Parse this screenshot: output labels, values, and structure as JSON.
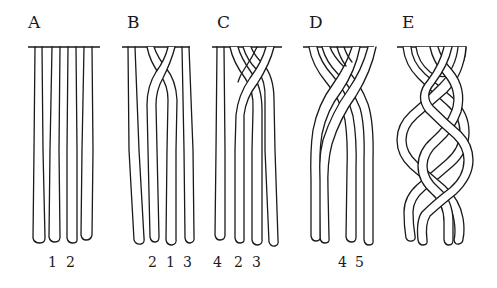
{
  "figure": {
    "stroke_color": "#1a1a1a",
    "background": "#ffffff",
    "panels": [
      {
        "id": "A",
        "label": "A",
        "label_pos": [
          28,
          14
        ],
        "bar": [
          28,
          100
        ],
        "numbers": [
          {
            "text": "1",
            "x": 48
          },
          {
            "text": "2",
            "x": 66
          }
        ]
      },
      {
        "id": "B",
        "label": "B",
        "label_pos": [
          127,
          14
        ],
        "bar": [
          122,
          190
        ],
        "numbers": [
          {
            "text": "2",
            "x": 148
          },
          {
            "text": "1",
            "x": 166
          },
          {
            "text": "3",
            "x": 183
          }
        ]
      },
      {
        "id": "C",
        "label": "C",
        "label_pos": [
          217,
          14
        ],
        "bar": [
          212,
          282
        ],
        "numbers": [
          {
            "text": "4",
            "x": 213
          },
          {
            "text": "2",
            "x": 234
          },
          {
            "text": "3",
            "x": 252
          }
        ]
      },
      {
        "id": "D",
        "label": "D",
        "label_pos": [
          309,
          14
        ],
        "bar": [
          303,
          374
        ],
        "numbers": [
          {
            "text": "4",
            "x": 338
          },
          {
            "text": "5",
            "x": 355
          }
        ]
      },
      {
        "id": "E",
        "label": "E",
        "label_pos": [
          402,
          14
        ],
        "bar": [
          397,
          466
        ],
        "numbers": []
      }
    ],
    "bar_y": 47,
    "number_y": 255
  }
}
